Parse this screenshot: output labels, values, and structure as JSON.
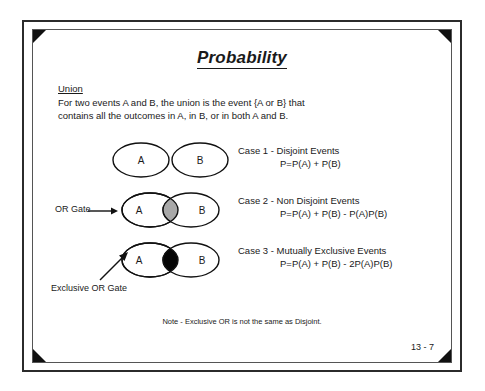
{
  "slide": {
    "title": "Probability",
    "page_number": "13 - 7",
    "footer_note": "Note - Exclusive OR is not the same as Disjoint."
  },
  "union": {
    "heading": "Union",
    "line1": "For two events A and B, the union is the event {A or B} that",
    "line2": "contains all the outcomes in A, in B, or in both A and B."
  },
  "labels": {
    "or_gate": "OR Gate",
    "exclusive_or_gate": "Exclusive OR Gate",
    "set_a": "A",
    "set_b": "B"
  },
  "cases": [
    {
      "id": "case-1",
      "title": "Case 1 - Disjoint Events",
      "formula": "P=P(A) + P(B)",
      "venn": "disjoint",
      "intersection_fill": "none"
    },
    {
      "id": "case-2",
      "title": "Case 2 - Non Disjoint Events",
      "formula": "P=P(A) + P(B) - P(A)P(B)",
      "venn": "overlapping",
      "intersection_fill": "#a8a8a8"
    },
    {
      "id": "case-3",
      "title": "Case 3 - Mutually Exclusive Events",
      "formula": "P=P(A) + P(B) - 2P(A)P(B)",
      "venn": "overlapping",
      "intersection_fill": "#050505"
    }
  ],
  "colors": {
    "ink": "#1a1a1a",
    "border": "#2b2b2b",
    "frame": "#555555",
    "corner": "#111111",
    "gray_fill": "#a8a8a8",
    "black_fill": "#050505",
    "paper": "#ffffff"
  }
}
